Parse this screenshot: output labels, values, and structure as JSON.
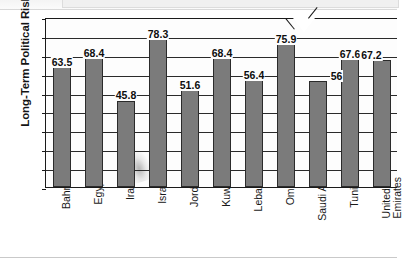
{
  "chart_data": {
    "type": "bar",
    "title": "",
    "xlabel": "",
    "ylabel": "Long-Term Political Risk",
    "ylim": [
      0,
      90
    ],
    "ytick_step": 10,
    "yticks": [
      90,
      80,
      70,
      60,
      50,
      40,
      30,
      20,
      10,
      0
    ],
    "grid": true,
    "legend": "none",
    "bar_color": "#7b7b7b",
    "bar_edge_color": "#2b2b2b",
    "plot_background": "#fdfdfd",
    "categories": [
      "Bahrain",
      "Egypt",
      "Iran",
      "Israel",
      "Jordan",
      "Kuwait",
      "Lebanon",
      "Oman",
      "Saudi Arabia",
      "Tunisia",
      "United Arab Emirates"
    ],
    "category_lines": [
      [
        "Bahrain"
      ],
      [
        "Egypt"
      ],
      [
        "Iran"
      ],
      [
        "Israel"
      ],
      [
        "Jordan"
      ],
      [
        "Kuwait"
      ],
      [
        "Lebanon"
      ],
      [
        "Oman"
      ],
      [
        "Saudi Arabia"
      ],
      [
        "Tunisia"
      ],
      [
        "United Arab",
        "Emirates"
      ]
    ],
    "values": [
      63.5,
      68.4,
      45.8,
      78.3,
      51.6,
      68.4,
      56.4,
      75.9,
      56,
      67.6,
      67.2
    ],
    "value_labels": [
      "63.5",
      "68.4",
      "45.8",
      "78.3",
      "51.6",
      "68.4",
      "56.4",
      "75.9",
      "56",
      "67.6",
      "67.2"
    ]
  }
}
